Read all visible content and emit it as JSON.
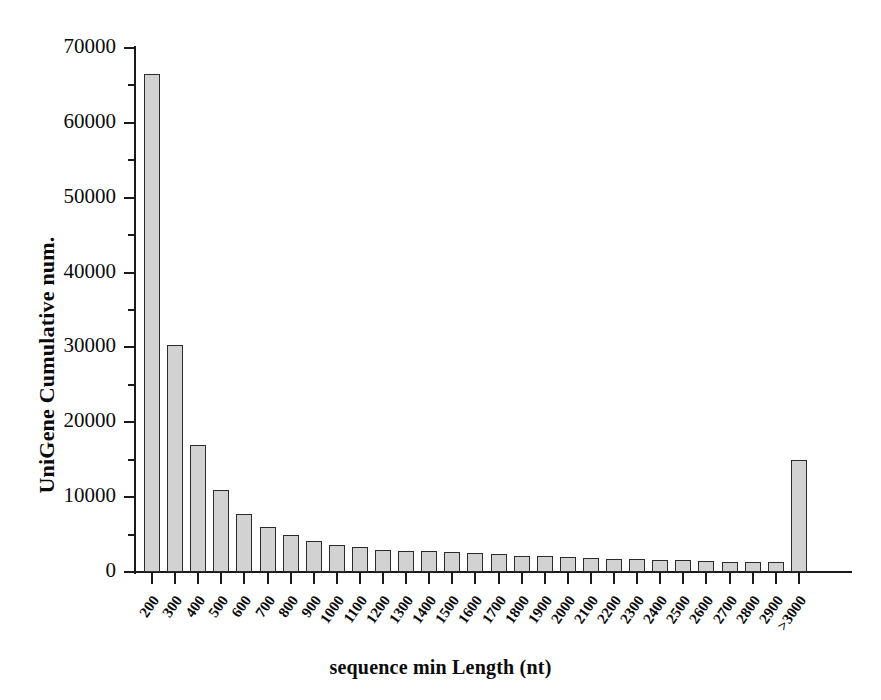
{
  "chart_data": {
    "type": "bar",
    "title": "",
    "xlabel": "sequence min Length (nt)",
    "ylabel": "UniGene Cumulative num.",
    "ylim": [
      0,
      70000
    ],
    "ytick_labels": [
      "0",
      "10000",
      "20000",
      "30000",
      "40000",
      "50000",
      "60000",
      "70000"
    ],
    "ytick_values": [
      0,
      10000,
      20000,
      30000,
      40000,
      50000,
      60000,
      70000
    ],
    "grid": false,
    "legend": "none",
    "categories": [
      "200",
      "300",
      "400",
      "500",
      "600",
      "700",
      "800",
      "900",
      "1000",
      "1100",
      "1200",
      "1300",
      "1400",
      "1500",
      "1600",
      "1700",
      "1800",
      "1900",
      "2000",
      "2100",
      "2200",
      "2300",
      "2400",
      "2500",
      "2600",
      "2700",
      "2800",
      "2900",
      ">3000"
    ],
    "values": [
      66500,
      30300,
      17000,
      11000,
      7800,
      6000,
      4900,
      4100,
      3600,
      3300,
      2900,
      2800,
      2750,
      2650,
      2500,
      2350,
      2200,
      2100,
      1950,
      1850,
      1800,
      1700,
      1650,
      1600,
      1500,
      1400,
      1350,
      1300,
      15000
    ],
    "bar_fill_color": "#d2d2d2",
    "bar_edge_color": "#2b2b2b",
    "axis_color": "#1a1a1a",
    "background_color": "#ffffff"
  }
}
